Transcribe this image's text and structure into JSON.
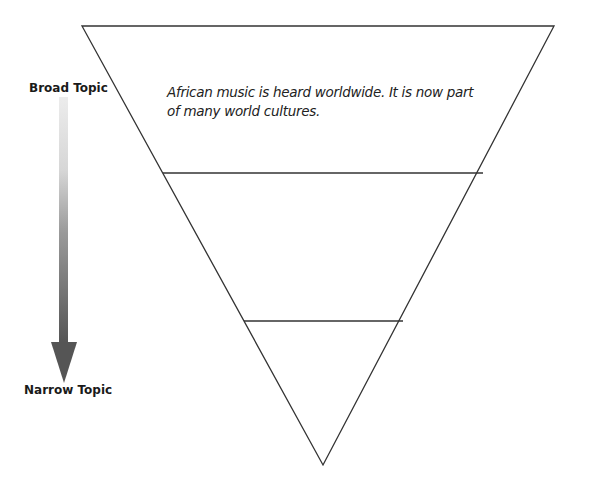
{
  "arrow": {
    "top_label": "Broad Topic",
    "bottom_label": "Narrow Topic",
    "direction": "down",
    "gradient_start_color": "#e6e6e6",
    "gradient_end_color": "#555555"
  },
  "funnel": {
    "type": "inverted-triangle",
    "level_count": 3,
    "line_color": "#333333",
    "levels": [
      {
        "position": "top",
        "text": "African music is heard worldwide. It is now part of many world cultures."
      },
      {
        "position": "middle",
        "text": ""
      },
      {
        "position": "bottom",
        "text": ""
      }
    ]
  }
}
